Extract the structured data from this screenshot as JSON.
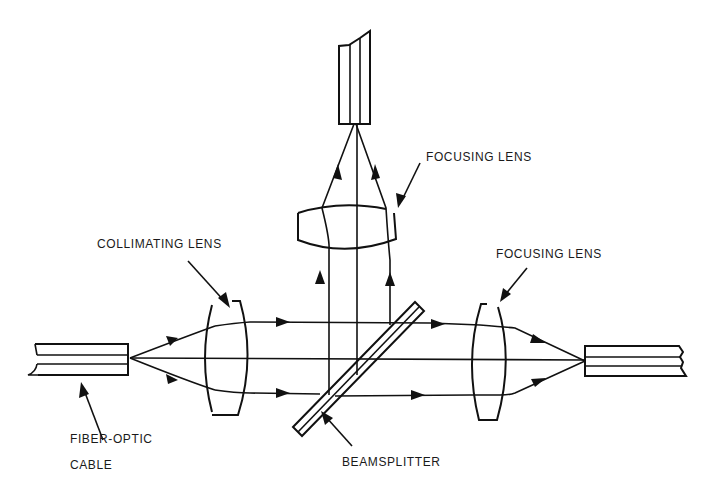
{
  "diagram": {
    "type": "optical-schematic",
    "labels": {
      "collimating_lens": "COLLIMATING  LENS",
      "focusing_lens_top": "FOCUSING LENS",
      "focusing_lens_right": "FOCUSING LENS",
      "fiber_optic_line1": "FIBER-OPTIC",
      "fiber_optic_line2": "CABLE",
      "beamsplitter": "BEAMSPLITTER"
    },
    "components": [
      {
        "id": "input-fiber",
        "name": "Fiber-optic cable (input)",
        "position": "left"
      },
      {
        "id": "collimating-lens",
        "name": "Collimating lens"
      },
      {
        "id": "beamsplitter",
        "name": "Beamsplitter",
        "orientation": "diagonal"
      },
      {
        "id": "focusing-lens-right",
        "name": "Focusing lens (transmitted path)"
      },
      {
        "id": "output-fiber-right",
        "name": "Fiber-optic cable (transmitted output)",
        "position": "right"
      },
      {
        "id": "focusing-lens-top",
        "name": "Focusing lens (reflected path)"
      },
      {
        "id": "output-fiber-top",
        "name": "Fiber-optic cable (reflected output)",
        "position": "top"
      }
    ],
    "colors": {
      "ink": "#111111",
      "background": "#ffffff"
    }
  }
}
